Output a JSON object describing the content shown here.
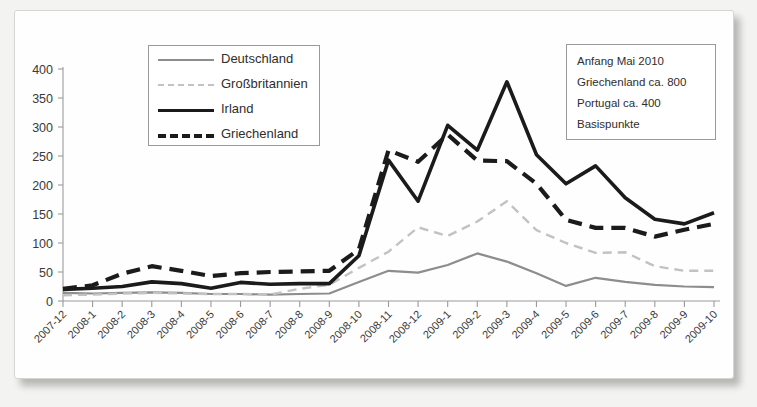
{
  "legend": {
    "items": [
      {
        "label": "Deutschland",
        "key": "deutschland",
        "color": "#8d8d8d",
        "style": "solid"
      },
      {
        "label": "Großbritannien",
        "key": "grossbritannien",
        "color": "#c2c2c2",
        "style": "dashed"
      },
      {
        "label": "Irland",
        "key": "irland",
        "color": "#1b1b1b",
        "style": "solid"
      },
      {
        "label": "Griechenland",
        "key": "griechenland",
        "color": "#1b1b1b",
        "style": "dashed"
      }
    ]
  },
  "annotation": {
    "lines": [
      "Anfang Mai 2010",
      "Griechenland ca. 800",
      "Portugal ca. 400",
      "Basispunkte"
    ]
  },
  "chart_data": {
    "type": "line",
    "title": "",
    "xlabel": "",
    "ylabel": "",
    "ylim": [
      0,
      400
    ],
    "yticks": [
      0,
      50,
      100,
      150,
      200,
      250,
      300,
      350,
      400
    ],
    "grid": false,
    "legend_position": "top-left",
    "categories": [
      "2007-12",
      "2008-1",
      "2008-2",
      "2008-3",
      "2008-4",
      "2008-5",
      "2008-6",
      "2008-7",
      "2008-8",
      "2008-9",
      "2008-10",
      "2008-11",
      "2008-12",
      "2009-1",
      "2009-2",
      "2009-3",
      "2009-4",
      "2009-5",
      "2009-6",
      "2009-7",
      "2009-8",
      "2009-9",
      "2009-10"
    ],
    "series": [
      {
        "name": "Deutschland",
        "color": "#8d8d8d",
        "style": "solid",
        "values": [
          14,
          13,
          14,
          15,
          14,
          12,
          12,
          11,
          12,
          13,
          33,
          52,
          49,
          62,
          82,
          68,
          48,
          26,
          40,
          33,
          28,
          25,
          24
        ]
      },
      {
        "name": "Großbritannien",
        "color": "#c2c2c2",
        "style": "dashed",
        "values": [
          10,
          11,
          13,
          14,
          13,
          12,
          12,
          11,
          21,
          28,
          57,
          85,
          127,
          112,
          137,
          172,
          122,
          100,
          83,
          84,
          60,
          52,
          52
        ]
      },
      {
        "name": "Irland",
        "color": "#1b1b1b",
        "style": "solid",
        "values": [
          20,
          22,
          25,
          33,
          30,
          22,
          32,
          29,
          30,
          30,
          78,
          243,
          172,
          303,
          260,
          378,
          252,
          202,
          233,
          178,
          141,
          133,
          152
        ]
      },
      {
        "name": "Griechenland",
        "color": "#1b1b1b",
        "style": "dashed",
        "values": [
          21,
          27,
          47,
          60,
          52,
          43,
          48,
          50,
          51,
          52,
          89,
          260,
          240,
          287,
          242,
          241,
          202,
          140,
          126,
          126,
          111,
          123,
          133
        ]
      }
    ]
  }
}
